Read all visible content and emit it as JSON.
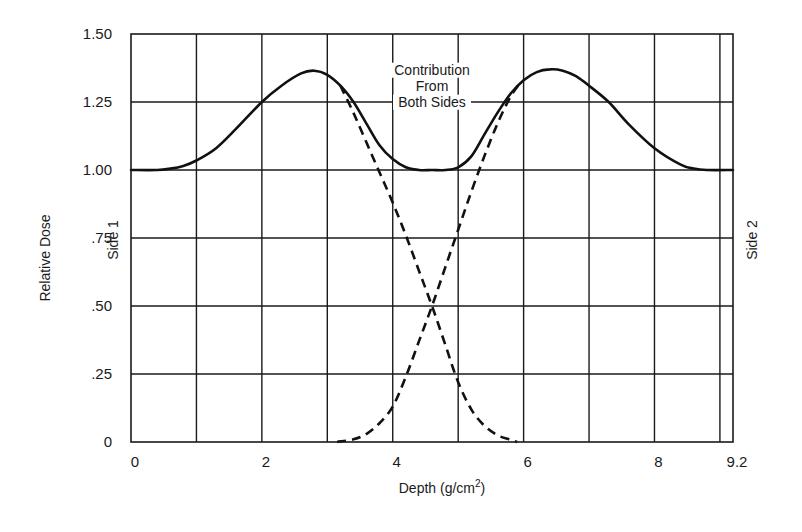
{
  "chart_data": {
    "type": "line",
    "title": "",
    "xlabel": "Depth (g/cm",
    "xlabel_sup": "2",
    "xlabel_close": ")",
    "ylabel": "Relative Dose",
    "left_side_label": "Side 1",
    "right_side_label": "Side 2",
    "xlim": [
      0,
      9.2
    ],
    "ylim": [
      0,
      1.5
    ],
    "grid": true,
    "x_gridlines": [
      1,
      2,
      3,
      4,
      5,
      6,
      7,
      8,
      9
    ],
    "y_gridlines": [
      0.25,
      0.5,
      0.75,
      1.0,
      1.25
    ],
    "x_ticks": [
      {
        "value": 0,
        "label": "0"
      },
      {
        "value": 2,
        "label": "2"
      },
      {
        "value": 4,
        "label": "4"
      },
      {
        "value": 6,
        "label": "6"
      },
      {
        "value": 8,
        "label": "8"
      },
      {
        "value": 9.2,
        "label": "9.2"
      }
    ],
    "y_ticks": [
      {
        "value": 0,
        "label": "0"
      },
      {
        "value": 0.25,
        "label": ".25"
      },
      {
        "value": 0.5,
        "label": ".50"
      },
      {
        "value": 0.75,
        "label": ".75"
      },
      {
        "value": 1.0,
        "label": "1.00"
      },
      {
        "value": 1.25,
        "label": "1.25"
      },
      {
        "value": 1.5,
        "label": "1.50"
      }
    ],
    "annotation": [
      "Contribution",
      "From",
      "Both Sides"
    ],
    "annotation_anchor": {
      "x": 4.6,
      "y": 1.24
    },
    "series": [
      {
        "name": "Contribution From Both Sides",
        "style": "solid",
        "x": [
          0,
          0.4,
          0.6,
          0.8,
          1.0,
          1.3,
          1.6,
          2.0,
          2.3,
          2.6,
          2.8,
          3.0,
          3.2,
          3.4,
          3.6,
          3.8,
          4.0,
          4.2,
          4.4,
          4.6,
          4.8,
          5.0,
          5.2,
          5.4,
          5.6,
          5.8,
          6.0,
          6.2,
          6.4,
          6.6,
          6.8,
          7.0,
          7.3,
          7.6,
          8.0,
          8.4,
          8.6,
          8.8,
          9.2
        ],
        "y": [
          1.0,
          1.0,
          1.005,
          1.015,
          1.035,
          1.08,
          1.15,
          1.25,
          1.31,
          1.355,
          1.365,
          1.35,
          1.31,
          1.25,
          1.17,
          1.09,
          1.04,
          1.01,
          1.0,
          1.0,
          1.0,
          1.01,
          1.05,
          1.13,
          1.21,
          1.28,
          1.33,
          1.36,
          1.37,
          1.365,
          1.345,
          1.31,
          1.25,
          1.17,
          1.08,
          1.02,
          1.005,
          1.0,
          1.0
        ]
      },
      {
        "name": "Side 1 contribution",
        "style": "dashed",
        "x": [
          3.2,
          3.4,
          3.6,
          3.8,
          4.0,
          4.2,
          4.4,
          4.6,
          4.8,
          5.0,
          5.2,
          5.4,
          5.6,
          5.8,
          5.9
        ],
        "y": [
          1.31,
          1.21,
          1.1,
          0.99,
          0.88,
          0.76,
          0.63,
          0.5,
          0.36,
          0.22,
          0.12,
          0.06,
          0.025,
          0.008,
          0.0
        ]
      },
      {
        "name": "Side 2 contribution",
        "style": "dashed",
        "x": [
          3.15,
          3.4,
          3.6,
          3.8,
          4.0,
          4.2,
          4.4,
          4.6,
          4.8,
          5.0,
          5.2,
          5.4,
          5.6,
          5.8,
          5.95
        ],
        "y": [
          0.0,
          0.01,
          0.03,
          0.07,
          0.13,
          0.24,
          0.37,
          0.5,
          0.64,
          0.78,
          0.92,
          1.05,
          1.17,
          1.27,
          1.32
        ]
      }
    ]
  }
}
